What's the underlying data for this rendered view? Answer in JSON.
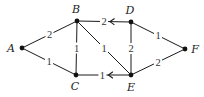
{
  "diagram": {
    "type": "weighted-graph",
    "nodes": [
      {
        "id": "A",
        "label": "A"
      },
      {
        "id": "B",
        "label": "B"
      },
      {
        "id": "C",
        "label": "C"
      },
      {
        "id": "D",
        "label": "D"
      },
      {
        "id": "E",
        "label": "E"
      },
      {
        "id": "F",
        "label": "F"
      }
    ],
    "edges": [
      {
        "from": "A",
        "to": "B",
        "weight": "2",
        "directed": false
      },
      {
        "from": "A",
        "to": "C",
        "weight": "1",
        "directed": false
      },
      {
        "from": "B",
        "to": "C",
        "weight": "1",
        "directed": false
      },
      {
        "from": "B",
        "to": "E",
        "weight": "1",
        "directed": false
      },
      {
        "from": "D",
        "to": "B",
        "weight": "2",
        "directed": true
      },
      {
        "from": "E",
        "to": "C",
        "weight": "1",
        "directed": true
      },
      {
        "from": "D",
        "to": "E",
        "weight": "2",
        "directed": false
      },
      {
        "from": "D",
        "to": "F",
        "weight": "1",
        "directed": false
      },
      {
        "from": "E",
        "to": "F",
        "weight": "2",
        "directed": false
      }
    ]
  }
}
